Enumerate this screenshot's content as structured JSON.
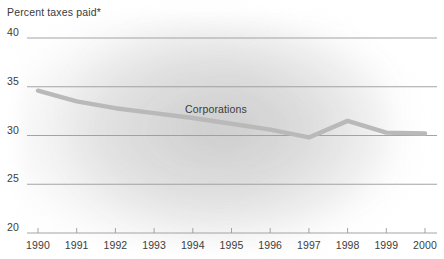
{
  "chart_data": {
    "type": "line",
    "title": "Percent taxes paid*",
    "xlabel": "",
    "ylabel": "",
    "ylim": [
      20,
      40
    ],
    "yticks": [
      20,
      25,
      30,
      35,
      40
    ],
    "ytick_labels": [
      "20",
      "25",
      "30",
      "35",
      "40"
    ],
    "grid": true,
    "legend_position": "inline-label",
    "x": [
      1990,
      1991,
      1992,
      1993,
      1994,
      1995,
      1996,
      1997,
      1998,
      1999,
      2000
    ],
    "xtick_labels": [
      "1990",
      "1991",
      "1992",
      "1993",
      "1994",
      "1995",
      "1996",
      "1997",
      "1998",
      "1999",
      "2000"
    ],
    "series": [
      {
        "name": "Corporations",
        "values": [
          34.6,
          33.5,
          32.8,
          32.3,
          31.8,
          31.2,
          30.6,
          29.8,
          31.5,
          30.3,
          30.2
        ],
        "color": "#b9b9b9"
      }
    ],
    "annotations": [
      {
        "text": "Corporations",
        "x": 1994.6,
        "y": 32.6
      }
    ],
    "footnote_marker": "*"
  },
  "style": {
    "gridline_color": "#9a9a9a",
    "axis_text_color": "#3c3c3c",
    "background": "#ffffff",
    "line_color": "#b9b9b9"
  }
}
